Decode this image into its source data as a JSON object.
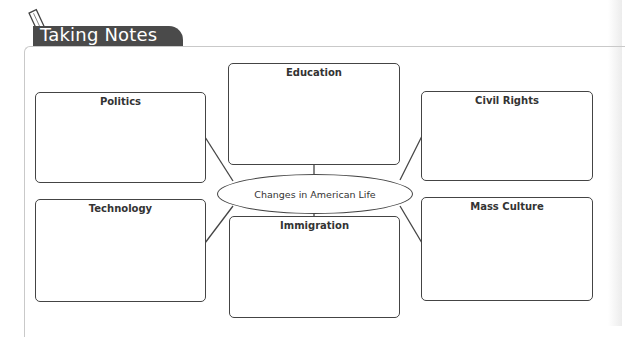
{
  "header": {
    "title": "Taking Notes",
    "icon": "pencil-icon",
    "tab_color": "#4a4a4a"
  },
  "diagram": {
    "center": {
      "label": "Changes in American Life"
    },
    "boxes": [
      {
        "id": "politics",
        "label": "Politics",
        "position": "top-left"
      },
      {
        "id": "education",
        "label": "Education",
        "position": "top-center"
      },
      {
        "id": "civil-rights",
        "label": "Civil Rights",
        "position": "top-right"
      },
      {
        "id": "technology",
        "label": "Technology",
        "position": "bottom-left"
      },
      {
        "id": "immigration",
        "label": "Immigration",
        "position": "bottom-center"
      },
      {
        "id": "mass-culture",
        "label": "Mass Culture",
        "position": "bottom-right"
      }
    ],
    "line_color": "#444444"
  }
}
